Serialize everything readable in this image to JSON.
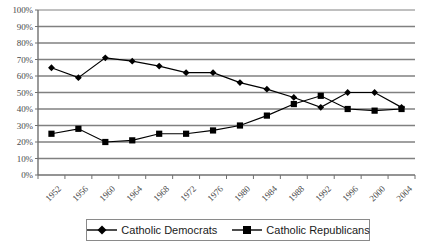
{
  "chart_data": {
    "type": "line",
    "title": "",
    "xlabel": "",
    "ylabel": "",
    "ylim": [
      0,
      100
    ],
    "ytick_labels": [
      "100%",
      "90%",
      "80%",
      "70%",
      "60%",
      "50%",
      "40%",
      "30%",
      "20%",
      "10%",
      "0%"
    ],
    "ytick_values": [
      100,
      90,
      80,
      70,
      60,
      50,
      40,
      30,
      20,
      10,
      0
    ],
    "grid": true,
    "legend_position": "bottom-center",
    "categories": [
      "1952",
      "1956",
      "1960",
      "1964",
      "1968",
      "1972",
      "1976",
      "1980",
      "1984",
      "1988",
      "1992",
      "1996",
      "2000",
      "2004"
    ],
    "series": [
      {
        "name": "Catholic Democrats",
        "marker": "diamond",
        "color": "#000000",
        "values": [
          65,
          59,
          71,
          69,
          66,
          62,
          62,
          56,
          52,
          47,
          41,
          50,
          50,
          41
        ]
      },
      {
        "name": "Catholic Republicans",
        "marker": "square",
        "color": "#000000",
        "values": [
          25,
          28,
          20,
          21,
          25,
          25,
          27,
          30,
          36,
          43,
          48,
          40,
          39,
          40
        ]
      }
    ]
  },
  "legend": {
    "entries": [
      {
        "label": "Catholic Democrats"
      },
      {
        "label": "Catholic Republicans"
      }
    ]
  },
  "colors": {
    "gridline": "#808080",
    "axis": "#707070",
    "series": "#000000",
    "text": "#4a4a4a",
    "legend_text": "#1a1a1a",
    "background": "#ffffff"
  }
}
